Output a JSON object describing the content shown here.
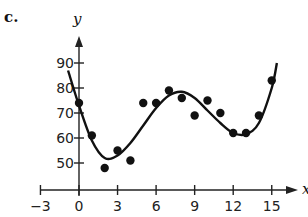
{
  "panel_label": "c.",
  "chart_data": {
    "type": "scatter",
    "title": "",
    "xlabel": "x",
    "ylabel": "y",
    "xlim": [
      -3,
      16
    ],
    "ylim": [
      40,
      95
    ],
    "grid": false,
    "legend": null,
    "x_ticks": [
      -3,
      0,
      3,
      6,
      9,
      12,
      15
    ],
    "x_tick_labels": [
      "−3",
      "0",
      "3",
      "6",
      "9",
      "12",
      "15"
    ],
    "y_ticks": [
      50,
      60,
      70,
      80,
      90
    ],
    "y_tick_labels": [
      "50",
      "60",
      "70",
      "80",
      "90"
    ],
    "series": [
      {
        "name": "data points",
        "kind": "scatter",
        "x": [
          0,
          1,
          2,
          3,
          4,
          5,
          6,
          7,
          8,
          9,
          10,
          11,
          12,
          13,
          14,
          15
        ],
        "y": [
          74,
          61,
          48,
          55,
          51,
          74,
          74,
          79,
          76,
          69,
          75,
          70,
          62,
          62,
          69,
          83
        ]
      },
      {
        "name": "fitted curve (polynomial)",
        "kind": "line",
        "x": [
          -0.85,
          0,
          1,
          2,
          3,
          4,
          5,
          6,
          7,
          8,
          9,
          10,
          11,
          12,
          13,
          14,
          15,
          15.4
        ],
        "y": [
          87,
          73,
          59,
          52,
          53,
          58,
          65,
          72,
          77,
          78.5,
          76,
          71,
          66,
          62,
          61.5,
          66,
          80,
          90
        ]
      }
    ],
    "annotations": []
  }
}
